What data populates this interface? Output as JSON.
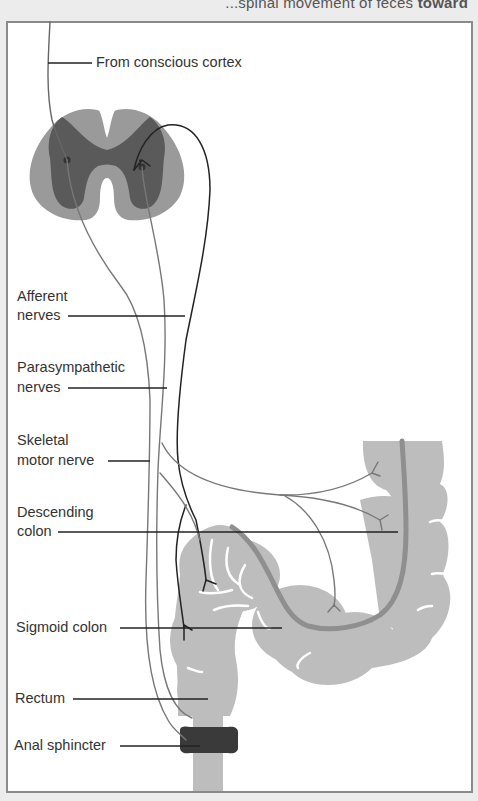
{
  "caption_fragment": {
    "text_partial": "...spinal movement of feces ",
    "text_bold": "toward"
  },
  "figure": {
    "labels": {
      "from_conscious_cortex": "From conscious cortex",
      "afferent_nerves_line1": "Afferent",
      "afferent_nerves_line2": "nerves",
      "parasympathetic_line1": "Parasympathetic",
      "parasympathetic_line2": "nerves",
      "skeletal_line1": "Skeletal",
      "skeletal_line2": "motor nerve",
      "descending_line1": "Descending",
      "descending_line2": "colon",
      "sigmoid_colon": "Sigmoid colon",
      "rectum": "Rectum",
      "anal_sphincter": "Anal sphincter"
    },
    "colors": {
      "frame_border": "#8a8a8a",
      "spinal_white_matter": "#9a9a9a",
      "spinal_grey_matter": "#5a5a5a",
      "colon_fill": "#bdbdbd",
      "colon_lumen": "#8f8f8f",
      "sphincter": "#3a3a3a",
      "nerve_light": "#777777",
      "nerve_dark": "#222222",
      "leader_line": "#222222"
    }
  }
}
